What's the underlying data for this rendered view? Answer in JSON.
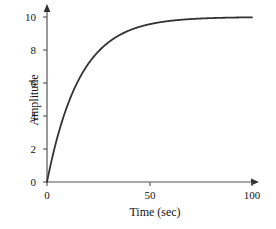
{
  "chart_data": {
    "type": "line",
    "title": "",
    "xlabel": "Time (sec)",
    "ylabel": "Amplitude",
    "xlim": [
      0,
      100
    ],
    "ylim": [
      0,
      10
    ],
    "xticks": [
      0,
      50,
      100
    ],
    "xtick_labels": [
      "0",
      "50",
      "100"
    ],
    "yticks": [
      0,
      2,
      4,
      6,
      8,
      10
    ],
    "ytick_labels": [
      "0",
      "2",
      "4",
      "6",
      "8",
      "10"
    ],
    "grid": false,
    "legend": null,
    "curve_color": "#333333",
    "axis_color": "#555555",
    "series": [
      {
        "name": "step response",
        "formula": "y = 10 * (1 - exp(-t/16))",
        "steady_state": 10,
        "time_constant": 16,
        "x": [
          0,
          2,
          4,
          6,
          8,
          10,
          12,
          14,
          16,
          18,
          20,
          25,
          30,
          35,
          40,
          45,
          50,
          55,
          60,
          65,
          70,
          75,
          80,
          85,
          90,
          95,
          100
        ],
        "y": [
          0,
          1.18,
          2.21,
          3.12,
          3.93,
          4.63,
          5.26,
          5.81,
          6.32,
          6.74,
          7.13,
          7.9,
          8.47,
          8.89,
          9.18,
          9.4,
          9.57,
          9.68,
          9.77,
          9.83,
          9.88,
          9.91,
          9.93,
          9.95,
          9.96,
          9.97,
          9.98
        ]
      }
    ]
  },
  "axis": {
    "origin_px": {
      "x": 47,
      "y": 182
    },
    "x_end_px": 258,
    "y_end_px": 6
  }
}
